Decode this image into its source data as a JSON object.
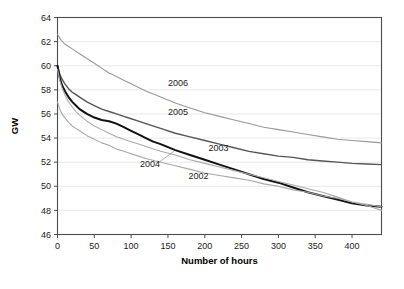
{
  "chart_data": {
    "type": "line",
    "title": "",
    "xlabel": "Number of hours",
    "ylabel": "GW",
    "xlim": [
      0,
      440
    ],
    "ylim": [
      46,
      64
    ],
    "xticks": [
      0,
      50,
      100,
      150,
      200,
      250,
      300,
      350,
      400
    ],
    "yticks": [
      46,
      48,
      50,
      52,
      54,
      56,
      58,
      60,
      62,
      64
    ],
    "grid": "horizontal",
    "legend_position": "inline-annotations",
    "series": [
      {
        "name": "2006",
        "color": "#999999",
        "width": 1.1,
        "label_x": 150,
        "label_y": 58.3,
        "x": [
          0,
          5,
          10,
          15,
          20,
          30,
          40,
          50,
          60,
          70,
          80,
          90,
          100,
          110,
          120,
          140,
          160,
          180,
          200,
          220,
          240,
          260,
          280,
          300,
          320,
          340,
          360,
          380,
          400,
          420,
          440
        ],
        "y": [
          62.6,
          62.1,
          61.8,
          61.6,
          61.4,
          61.0,
          60.6,
          60.2,
          59.8,
          59.4,
          59.1,
          58.8,
          58.5,
          58.2,
          57.9,
          57.4,
          56.9,
          56.5,
          56.1,
          55.8,
          55.5,
          55.2,
          54.9,
          54.7,
          54.5,
          54.3,
          54.1,
          53.9,
          53.8,
          53.7,
          53.6
        ]
      },
      {
        "name": "2005",
        "color": "#555555",
        "width": 1.4,
        "label_x": 150,
        "label_y": 55.9,
        "x": [
          0,
          3,
          6,
          10,
          15,
          20,
          25,
          30,
          40,
          50,
          60,
          70,
          80,
          90,
          100,
          110,
          120,
          140,
          160,
          180,
          200,
          220,
          240,
          260,
          280,
          300,
          320,
          340,
          360,
          380,
          400,
          420,
          440
        ],
        "y": [
          60.0,
          59.3,
          58.9,
          58.5,
          58.1,
          57.8,
          57.6,
          57.4,
          57.0,
          56.7,
          56.4,
          56.2,
          56.0,
          55.8,
          55.6,
          55.4,
          55.2,
          54.8,
          54.4,
          54.1,
          53.8,
          53.5,
          53.2,
          52.9,
          52.7,
          52.5,
          52.4,
          52.2,
          52.1,
          52.0,
          51.9,
          51.85,
          51.8
        ]
      },
      {
        "name": "2003",
        "color": "#111111",
        "width": 2.0,
        "label_x": 205,
        "label_y": 52.9,
        "x": [
          0,
          3,
          6,
          10,
          15,
          20,
          25,
          30,
          40,
          50,
          60,
          70,
          80,
          90,
          100,
          110,
          120,
          130,
          140,
          160,
          180,
          200,
          220,
          240,
          260,
          280,
          300,
          320,
          340,
          360,
          380,
          400,
          420,
          440
        ],
        "y": [
          60.0,
          59.0,
          58.4,
          57.9,
          57.4,
          57.0,
          56.7,
          56.4,
          56.0,
          55.7,
          55.5,
          55.4,
          55.2,
          54.9,
          54.6,
          54.3,
          54.0,
          53.7,
          53.5,
          53.0,
          52.6,
          52.2,
          51.8,
          51.4,
          51.0,
          50.6,
          50.3,
          49.9,
          49.5,
          49.2,
          48.9,
          48.6,
          48.4,
          48.3
        ]
      },
      {
        "name": "2004",
        "color": "#aaaaaa",
        "width": 1.1,
        "label_x": 112,
        "label_y": 51.6,
        "leader": {
          "x1": 138,
          "y1": 52.0,
          "x2": 158,
          "y2": 52.9
        },
        "x": [
          0,
          3,
          6,
          10,
          15,
          20,
          25,
          30,
          40,
          50,
          60,
          70,
          80,
          90,
          100,
          110,
          120,
          140,
          160,
          180,
          200,
          220,
          240,
          260,
          280,
          300,
          320,
          340,
          360,
          380,
          400,
          420,
          440
        ],
        "y": [
          59.7,
          58.8,
          58.2,
          57.6,
          57.0,
          56.6,
          56.2,
          55.9,
          55.4,
          55.0,
          54.7,
          54.4,
          54.1,
          53.9,
          53.7,
          53.5,
          53.3,
          52.9,
          52.6,
          52.2,
          51.9,
          51.6,
          51.3,
          51.0,
          50.7,
          50.4,
          50.1,
          49.8,
          49.5,
          49.1,
          48.7,
          48.4,
          48.0
        ]
      },
      {
        "name": "2002",
        "color": "#a8a8a8",
        "width": 1.1,
        "label_x": 178,
        "label_y": 50.6,
        "x": [
          0,
          3,
          6,
          10,
          15,
          20,
          25,
          30,
          40,
          50,
          60,
          70,
          80,
          90,
          100,
          110,
          120,
          140,
          160,
          180,
          200,
          220,
          240,
          260,
          280,
          300,
          320,
          340,
          360,
          380,
          400,
          420,
          440
        ],
        "y": [
          57.0,
          56.4,
          56.0,
          55.7,
          55.3,
          55.0,
          54.8,
          54.6,
          54.2,
          53.9,
          53.6,
          53.4,
          53.1,
          52.9,
          52.7,
          52.5,
          52.3,
          52.0,
          51.7,
          51.4,
          51.1,
          50.9,
          50.7,
          50.5,
          50.2,
          50.0,
          49.7,
          49.5,
          49.2,
          49.0,
          48.7,
          48.5,
          48.3
        ]
      }
    ]
  }
}
